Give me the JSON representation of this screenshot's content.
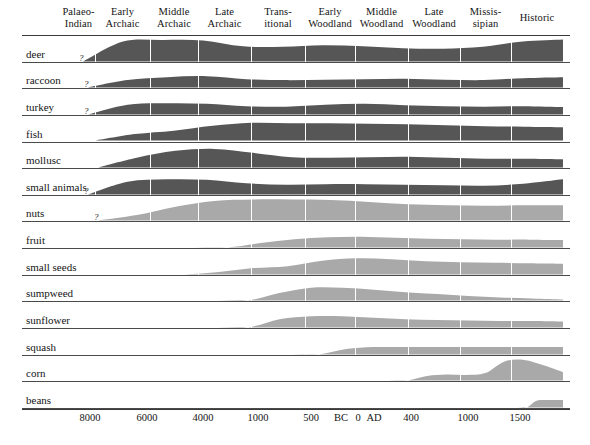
{
  "figure": {
    "animal_color": "#565656",
    "plant_color": "#a9a9a9",
    "rule_color": "#3a3a3a",
    "background": "#ffffff"
  },
  "periods": [
    {
      "lines": [
        "Palaeo-",
        "Indian"
      ],
      "x0": 62,
      "x1": 95
    },
    {
      "lines": [
        "Early",
        "Archaic"
      ],
      "x0": 95,
      "x1": 150
    },
    {
      "lines": [
        "Middle",
        "Archaic"
      ],
      "x0": 150,
      "x1": 198
    },
    {
      "lines": [
        "Late",
        "Archaic"
      ],
      "x0": 198,
      "x1": 251
    },
    {
      "lines": [
        "Trans-",
        "itional"
      ],
      "x0": 251,
      "x1": 305
    },
    {
      "lines": [
        "Early",
        "Woodland"
      ],
      "x0": 305,
      "x1": 355
    },
    {
      "lines": [
        "Middle",
        "Woodland"
      ],
      "x0": 355,
      "x1": 408
    },
    {
      "lines": [
        "Late",
        "Woodland"
      ],
      "x0": 408,
      "x1": 460
    },
    {
      "lines": [
        "Missis-",
        "sipian"
      ],
      "x0": 460,
      "x1": 511
    },
    {
      "lines": [
        "Historic"
      ],
      "x0": 511,
      "x1": 563
    }
  ],
  "column_separators": [
    95,
    150,
    198,
    251,
    305,
    355,
    408,
    460,
    511
  ],
  "plot": {
    "left": 62,
    "right": 563,
    "top": 36,
    "bottom": 409
  },
  "axis": {
    "ticks": [
      {
        "label": "8000",
        "x": 90
      },
      {
        "label": "6000",
        "x": 147
      },
      {
        "label": "4000",
        "x": 203
      },
      {
        "label": "1000",
        "x": 258
      },
      {
        "label": "500",
        "x": 311
      },
      {
        "label": "BC",
        "x": 341
      },
      {
        "label": "0",
        "x": 358
      },
      {
        "label": "AD",
        "x": 374
      },
      {
        "label": "400",
        "x": 411
      },
      {
        "label": "1000",
        "x": 468
      },
      {
        "label": "1500",
        "x": 520
      }
    ]
  },
  "chart_data": {
    "type": "area",
    "xlabel": "",
    "ylabel": "",
    "grid": false,
    "legend": "none",
    "x_categories": [
      "Palaeo-Indian",
      "Early Archaic",
      "Middle Archaic",
      "Late Archaic",
      "Transitional",
      "Early Woodland",
      "Middle Woodland",
      "Late Woodland",
      "Mississipian",
      "Historic"
    ],
    "x_tick_labels": [
      "8000",
      "6000",
      "4000",
      "1000",
      "500",
      "BC",
      "0",
      "AD",
      "400",
      "1000",
      "1500"
    ],
    "series": [
      {
        "name": "deer",
        "group": "animal",
        "uncertain_start": true,
        "start_x": 83,
        "values": [
          0.0,
          0.82,
          0.88,
          0.86,
          0.62,
          0.6,
          0.66,
          0.62,
          0.54,
          0.52,
          0.6,
          0.82,
          0.9
        ]
      },
      {
        "name": "raccoon",
        "group": "animal",
        "uncertain_start": true,
        "start_x": 88,
        "values": [
          0.0,
          0.3,
          0.42,
          0.46,
          0.34,
          0.3,
          0.32,
          0.34,
          0.36,
          0.32,
          0.3,
          0.38,
          0.42
        ]
      },
      {
        "name": "turkey",
        "group": "animal",
        "uncertain_start": true,
        "start_x": 88,
        "values": [
          0.0,
          0.4,
          0.46,
          0.44,
          0.34,
          0.32,
          0.4,
          0.44,
          0.38,
          0.34,
          0.32,
          0.34,
          0.3
        ]
      },
      {
        "name": "fish",
        "group": "animal",
        "uncertain_start": false,
        "start_x": 96,
        "values": [
          0.0,
          0.26,
          0.4,
          0.6,
          0.72,
          0.7,
          0.7,
          0.68,
          0.66,
          0.62,
          0.58,
          0.56,
          0.54
        ]
      },
      {
        "name": "mollusc",
        "group": "animal",
        "uncertain_start": false,
        "start_x": 98,
        "values": [
          0.0,
          0.4,
          0.68,
          0.76,
          0.6,
          0.42,
          0.4,
          0.42,
          0.44,
          0.4,
          0.36,
          0.36,
          0.34
        ]
      },
      {
        "name": "small animals",
        "group": "animal",
        "uncertain_start": true,
        "start_x": 88,
        "values": [
          0.0,
          0.52,
          0.62,
          0.6,
          0.46,
          0.4,
          0.42,
          0.42,
          0.4,
          0.38,
          0.36,
          0.44,
          0.62
        ]
      },
      {
        "name": "nuts",
        "group": "plant",
        "uncertain_start": true,
        "start_x": 98,
        "values": [
          0.0,
          0.22,
          0.56,
          0.8,
          0.86,
          0.86,
          0.84,
          0.76,
          0.66,
          0.62,
          0.6,
          0.62,
          0.62
        ]
      },
      {
        "name": "fruit",
        "group": "plant",
        "uncertain_start": false,
        "start_x": 160,
        "values": [
          0.0,
          0.0,
          0.0,
          0.18,
          0.34,
          0.42,
          0.44,
          0.4,
          0.36,
          0.34,
          0.32,
          0.32,
          0.3
        ]
      },
      {
        "name": "small seeds",
        "group": "plant",
        "uncertain_start": false,
        "start_x": 150,
        "values": [
          0.0,
          0.0,
          0.1,
          0.26,
          0.34,
          0.56,
          0.66,
          0.62,
          0.54,
          0.5,
          0.48,
          0.46,
          0.44
        ]
      },
      {
        "name": "sumpweed",
        "group": "plant",
        "uncertain_start": false,
        "start_x": 185,
        "values": [
          0.0,
          0.0,
          0.0,
          0.3,
          0.52,
          0.52,
          0.44,
          0.34,
          0.26,
          0.18,
          0.12,
          0.08,
          0.04
        ]
      },
      {
        "name": "sunflower",
        "group": "plant",
        "uncertain_start": false,
        "start_x": 185,
        "values": [
          0.0,
          0.0,
          0.0,
          0.34,
          0.46,
          0.46,
          0.4,
          0.34,
          0.3,
          0.28,
          0.26,
          0.26,
          0.24
        ]
      },
      {
        "name": "squash",
        "group": "plant",
        "uncertain_start": false,
        "start_x": 238,
        "values": [
          0.0,
          0.0,
          0.0,
          0.0,
          0.22,
          0.3,
          0.3,
          0.3,
          0.3,
          0.3,
          0.3,
          0.3,
          0.3
        ]
      },
      {
        "name": "corn",
        "group": "plant",
        "uncertain_start": false,
        "start_x": 330,
        "values": [
          0.0,
          0.0,
          0.0,
          0.0,
          0.0,
          0.18,
          0.24,
          0.22,
          0.3,
          0.78,
          0.84,
          0.62,
          0.34
        ]
      },
      {
        "name": "beans",
        "group": "plant",
        "uncertain_start": false,
        "start_x": 455,
        "values": [
          0.0,
          0.0,
          0.0,
          0.0,
          0.0,
          0.0,
          0.0,
          0.0,
          0.0,
          0.26,
          0.3,
          0.3,
          0.3
        ]
      }
    ]
  }
}
